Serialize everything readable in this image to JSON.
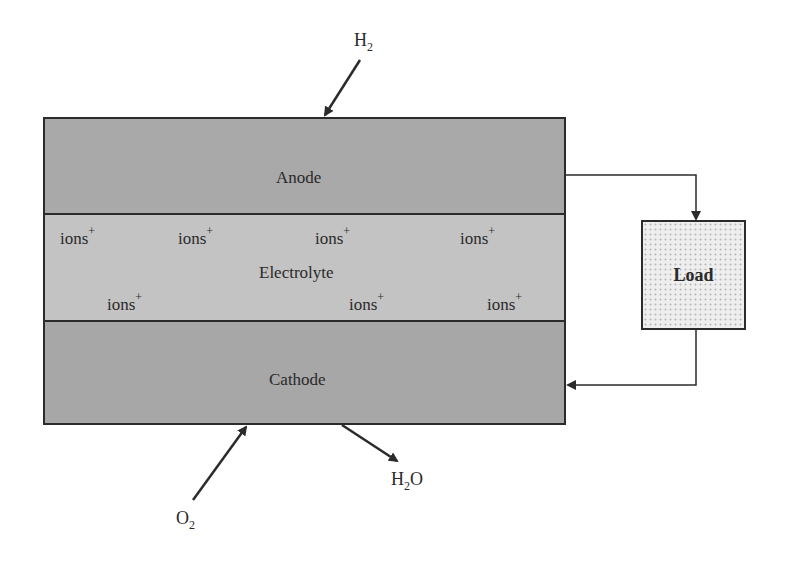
{
  "diagram": {
    "layers": {
      "anode": "Anode",
      "electrolyte": "Electrolyte",
      "cathode": "Cathode"
    },
    "ion_label": "ions",
    "ion_charge": "+",
    "load_label": "Load",
    "inputs": {
      "hydrogen": {
        "base": "H",
        "sub": "2"
      },
      "oxygen": {
        "base": "O",
        "sub": "2"
      }
    },
    "outputs": {
      "water": {
        "pre": "H",
        "sub": "2",
        "post": "O"
      }
    },
    "colors": {
      "anode": "#a9a9a9",
      "electrolyte": "#c3c3c3",
      "cathode": "#a7a7a7",
      "line": "#2b2b2b"
    }
  }
}
